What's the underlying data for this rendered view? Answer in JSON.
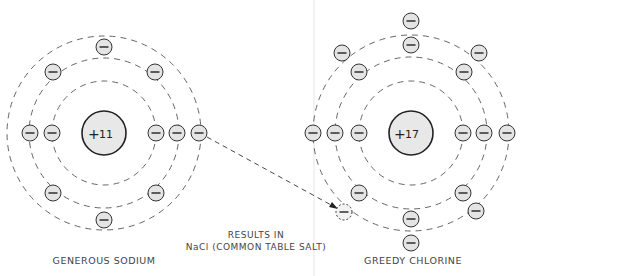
{
  "diagram": {
    "type": "ionic-bond-electron-transfer",
    "caption_line1": "RESULTS IN",
    "caption_line2": "NaCl (COMMON TABLE SALT)",
    "atoms": [
      {
        "id": "sodium",
        "label": "GENEROUS SODIUM",
        "nucleus_sign": "+",
        "nucleus_charge": "11",
        "electron_sign": "−",
        "electron_count": 11
      },
      {
        "id": "chlorine",
        "label": "GREEDY CHLORINE",
        "nucleus_sign": "+",
        "nucleus_charge": "17",
        "electron_sign": "−",
        "electron_count": 17
      }
    ],
    "arrow": {
      "from": "sodium outer electron",
      "to": "chlorine outer shell",
      "style": "dashed"
    },
    "colors": {
      "line": "#333333",
      "fill": "#e4e4e4",
      "text": "#444444",
      "background": "#ffffff"
    }
  }
}
